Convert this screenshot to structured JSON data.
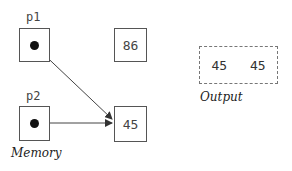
{
  "memory": {
    "caption": "Memory",
    "pointers": [
      {
        "name": "p1",
        "target": "45"
      },
      {
        "name": "p2",
        "target": "45"
      }
    ],
    "cells": [
      {
        "value": "86"
      },
      {
        "value": "45"
      }
    ]
  },
  "output": {
    "caption": "Output",
    "values": [
      "45",
      "45"
    ]
  }
}
